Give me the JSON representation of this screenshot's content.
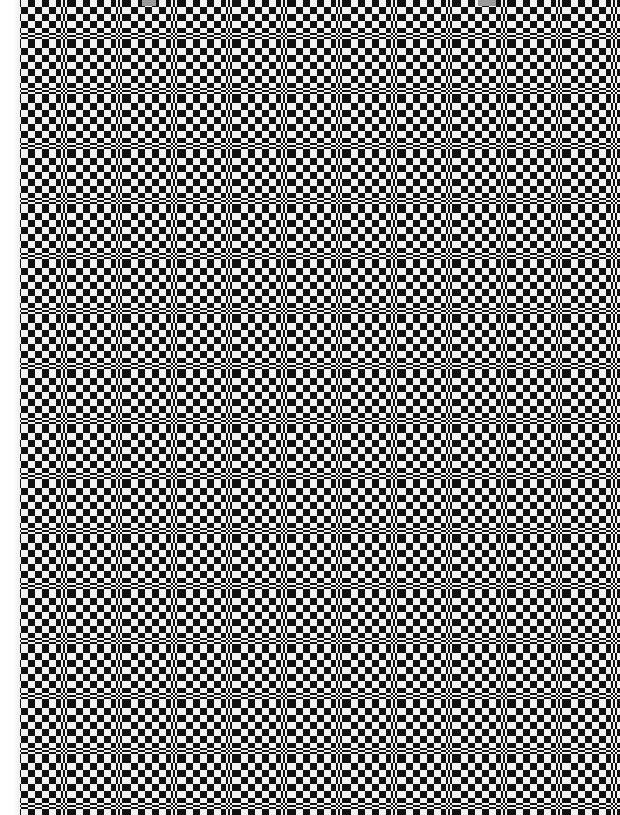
{
  "image": {
    "description": "Checkerboard optical illusion with periodic compressed bands",
    "width": 620,
    "height": 815,
    "left_margin_px": 20,
    "cell_px": 7,
    "band_period_px": 55,
    "band_width_px": 8,
    "colors": {
      "dark": "#111111",
      "light": "#f2f2f2",
      "band": "#777777",
      "margin": "#ffffff",
      "chip": "#9a9a9a"
    },
    "chips": [
      {
        "x": 142,
        "w": 14
      },
      {
        "x": 478,
        "w": 18
      }
    ]
  }
}
